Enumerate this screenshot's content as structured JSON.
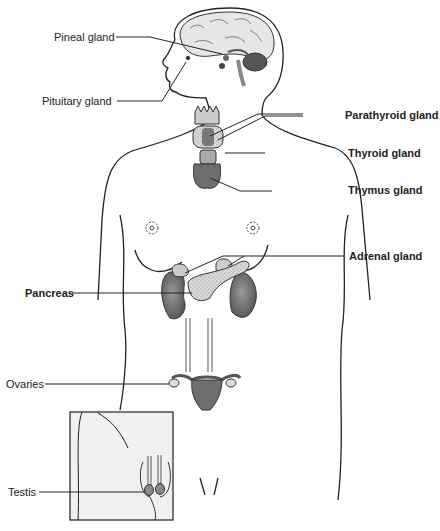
{
  "diagram": {
    "labels_left": [
      {
        "id": "pineal",
        "text": "Pineal gland"
      },
      {
        "id": "pituitary",
        "text": "Pituitary gland"
      },
      {
        "id": "pancreas",
        "text": "Pancreas"
      },
      {
        "id": "ovaries",
        "text": "Ovaries"
      },
      {
        "id": "testis",
        "text": "Testis"
      }
    ],
    "labels_right": [
      {
        "id": "parathyroid",
        "text": "Parathyroid gland"
      },
      {
        "id": "thyroid",
        "text": "Thyroid gland"
      },
      {
        "id": "thymus",
        "text": "Thymus gland"
      },
      {
        "id": "adrenal",
        "text": "Adrenal gland"
      }
    ],
    "colors": {
      "organ_dark": "#6e6e6e",
      "organ_light": "#d4d4d4",
      "outline": "#222222",
      "inset_bg": "#f0f0f0"
    }
  }
}
